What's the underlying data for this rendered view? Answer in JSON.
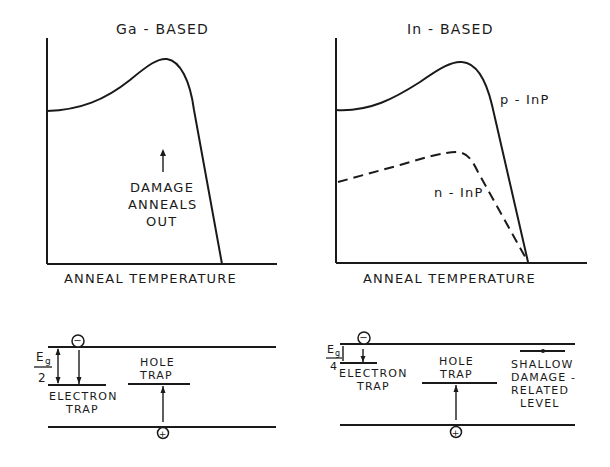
{
  "panels": {
    "left_plot": {
      "title": "Ga - BASED",
      "xlabel": "ANNEAL TEMPERATURE",
      "annotation": [
        "DAMAGE",
        "ANNEALS",
        "OUT"
      ]
    },
    "right_plot": {
      "title": "In - BASED",
      "xlabel": "ANNEAL TEMPERATURE",
      "curve_labels": {
        "solid": "p - InP",
        "dashed": "n - InP"
      }
    },
    "left_band": {
      "energy_label_top": "E",
      "energy_label_sub": "g",
      "energy_label_den": "2",
      "electron_trap": [
        "ELECTRON",
        "TRAP"
      ],
      "hole_trap": [
        "HOLE",
        "TRAP"
      ],
      "electron_symbol": "−",
      "hole_symbol": "+"
    },
    "right_band": {
      "energy_label_top": "E",
      "energy_label_sub": "g",
      "energy_label_den": "4",
      "electron_trap": [
        "ELECTRON",
        "TRAP"
      ],
      "hole_trap": [
        "HOLE",
        "TRAP"
      ],
      "shallow_level": [
        "SHALLOW",
        "DAMAGE -",
        "RELATED",
        "LEVEL"
      ],
      "electron_symbol": "−",
      "hole_symbol": "+"
    }
  },
  "colors": {
    "ink": "#1a1a1a",
    "background": "#ffffff"
  }
}
